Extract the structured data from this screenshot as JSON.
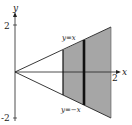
{
  "diagram": {
    "axes": {
      "x_label": "x",
      "y_label": "y",
      "x_tick": "2",
      "y_tick_top": "2",
      "y_tick_bottom": "-2"
    },
    "lines": {
      "upper_label": "y=x",
      "lower_label": "y=−x"
    },
    "colors": {
      "shade": "#a6a6a6",
      "line": "#222222",
      "background": "#ffffff"
    }
  }
}
